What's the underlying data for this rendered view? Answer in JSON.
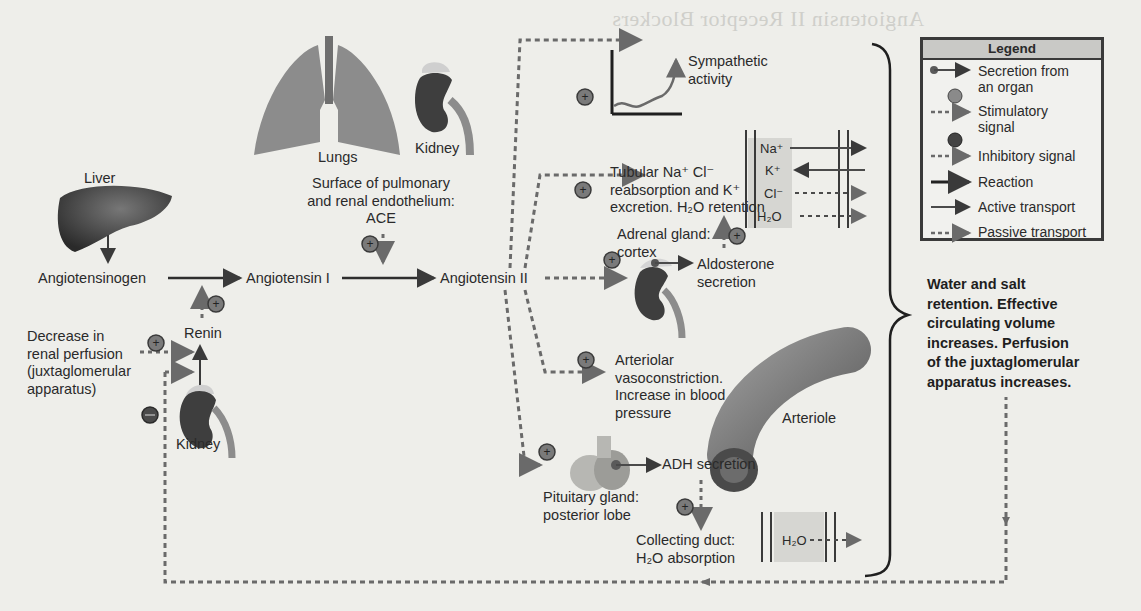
{
  "page": {
    "bleed_through_heading": "Angiotensin II Receptor Blockers"
  },
  "organs": {
    "lungs": "Lungs",
    "kidney_top": "Kidney",
    "liver": "Liver",
    "kidney_bottom": "Kidney",
    "arteriole": "Arteriole"
  },
  "nodes": {
    "surface_line1": "Surface of pulmonary",
    "surface_line2": "and renal endothelium:",
    "ace": "ACE",
    "angiotensinogen": "Angiotensinogen",
    "angiotensin_i": "Angiotensin I",
    "angiotensin_ii": "Angiotensin II",
    "renin": "Renin",
    "decrease_line1": "Decrease in",
    "decrease_line2": "renal perfusion",
    "decrease_line3": "(juxtaglomerular",
    "decrease_line4": "apparatus)",
    "sympathetic_line1": "Sympathetic",
    "sympathetic_line2": "activity",
    "tubular_line1": "Tubular Na⁺ Cl⁻",
    "tubular_line2": "reabsorption and K⁺",
    "tubular_line3": "excretion. H₂O retention",
    "adrenal_line1": "Adrenal gland:",
    "adrenal_line2": "cortex",
    "aldosterone_line1": "Aldosterone",
    "aldosterone_line2": "secretion",
    "arteriolar_line1": "Arteriolar",
    "arteriolar_line2": "vasoconstriction.",
    "arteriolar_line3": "Increase in blood",
    "arteriolar_line4": "pressure",
    "adh": "ADH secretion",
    "pituitary_line1": "Pituitary gland:",
    "pituitary_line2": "posterior lobe",
    "collecting_line1": "Collecting duct:",
    "collecting_line2": "H₂O absorption"
  },
  "membrane_top": {
    "ions": [
      "Na⁺",
      "K⁺",
      "Cl⁻",
      "H₂O"
    ]
  },
  "membrane_bottom": {
    "ion": "H₂O"
  },
  "outcome": {
    "line1": "Water and salt",
    "line2": "retention. Effective",
    "line3": "circulating volume",
    "line4": "increases. Perfusion",
    "line5": "of the juxtaglomerular",
    "line6": "apparatus increases."
  },
  "legend": {
    "title": "Legend",
    "items": [
      {
        "label1": "Secretion from",
        "label2": "an organ"
      },
      {
        "label1": "Stimulatory",
        "label2": "signal"
      },
      {
        "label1": "Inhibitory signal",
        "label2": ""
      },
      {
        "label1": "Reaction",
        "label2": ""
      },
      {
        "label1": "Active transport",
        "label2": ""
      },
      {
        "label1": "Passive transport",
        "label2": ""
      }
    ]
  },
  "signs": {
    "plus": "+",
    "minus": "−"
  },
  "colors": {
    "background": "#eeeeea",
    "organ_dark": "#3d3d3d",
    "organ_mid": "#8a8a8a",
    "signal_gray": "#7a7a7a",
    "line_dark": "#2e2e2e"
  }
}
